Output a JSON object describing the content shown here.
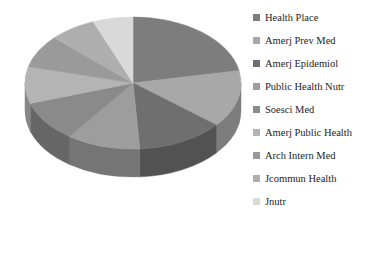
{
  "chart_data": {
    "type": "pie",
    "title": "",
    "subtitle": "",
    "xlabel": "",
    "ylabel": "",
    "grid": false,
    "legend_position": "right",
    "three_d": true,
    "start_angle_deg": 0,
    "direction": "clockwise",
    "categories": [
      "Health Place",
      "Amerj Prev Med",
      "Amerj Epidemiol",
      "Public Health Nutr",
      "Soesci Med",
      "Amerj Public Health",
      "Arch Intern Med",
      "Jcommun Health",
      "Jnutr"
    ],
    "values": [
      22,
      14,
      13,
      11,
      10,
      9,
      8,
      7,
      6
    ],
    "colors": [
      "#7d7d7d",
      "#a8a8a8",
      "#6f6f6f",
      "#9d9d9d",
      "#8a8a8a",
      "#b4b4b4",
      "#9a9a9a",
      "#aeaeae",
      "#d9d9d9"
    ],
    "side_colors": [
      "#5c5c5c",
      "#7d7d7d",
      "#525252",
      "#757575",
      "#666666",
      "#878787",
      "#737373",
      "#828282",
      "#a5a5a5"
    ]
  },
  "legend": {
    "items": [
      {
        "label": "Health Place",
        "swatch": "#7d7d7d"
      },
      {
        "label": "Amerj Prev Med",
        "swatch": "#a8a8a8"
      },
      {
        "label": "Amerj Epidemiol",
        "swatch": "#6f6f6f"
      },
      {
        "label": "Public Health Nutr",
        "swatch": "#9d9d9d"
      },
      {
        "label": "Soesci Med",
        "swatch": "#8a8a8a"
      },
      {
        "label": "Amerj Public Health",
        "swatch": "#b4b4b4"
      },
      {
        "label": "Arch Intern Med",
        "swatch": "#9a9a9a"
      },
      {
        "label": "Jcommun Health",
        "swatch": "#aeaeae"
      },
      {
        "label": "Jnutr",
        "swatch": "#d9d9d9"
      }
    ]
  },
  "geometry": {
    "cx": 133,
    "cy": 83,
    "rx": 108,
    "ry": 66,
    "depth": 28
  }
}
